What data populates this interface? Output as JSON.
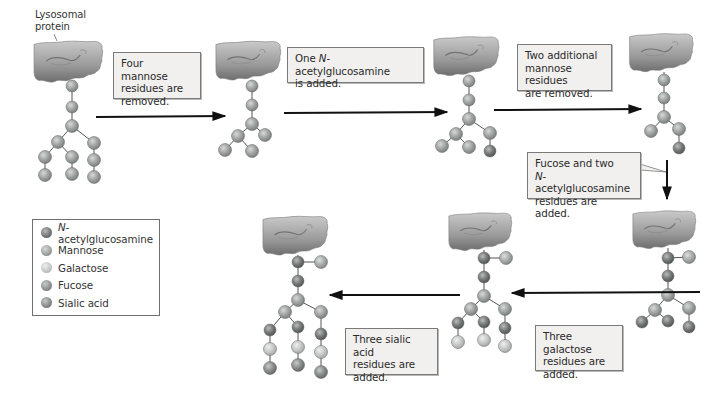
{
  "title_label": {
    "line1": "Lysosomal",
    "line2": "protein"
  },
  "steps": [
    {
      "id": 1,
      "lines": [
        "Four mannose",
        "residues are",
        "removed."
      ]
    },
    {
      "id": 2,
      "lines_prefix": "One ",
      "italic": "N",
      "lines_rest": "-acetylglucosamine",
      "line2": "is added."
    },
    {
      "id": 3,
      "lines": [
        "Two additional",
        "mannose residues",
        "are removed."
      ]
    },
    {
      "id": 4,
      "line1": "Fucose and two",
      "italic": "N",
      "line2_rest": "-acetylglucosamine",
      "line3": "residues are added."
    },
    {
      "id": 5,
      "lines": [
        "Three galactose",
        "residues are",
        "added."
      ]
    },
    {
      "id": 6,
      "lines": [
        "Three sialic acid",
        "residues are",
        "added."
      ]
    }
  ],
  "legend": {
    "items": [
      {
        "italic": "N",
        "label": "-acetylglucosamine",
        "color": "#6f7371"
      },
      {
        "italic": "",
        "label": "Mannose",
        "color": "#9a9e9c"
      },
      {
        "italic": "",
        "label": "Galactose",
        "color": "#c4c7c5"
      },
      {
        "italic": "",
        "label": "Fucose",
        "color": "#8c908e"
      },
      {
        "italic": "",
        "label": "Sialic acid",
        "color": "#888c8a"
      }
    ]
  },
  "colors": {
    "glcnac": "#6f7371",
    "mannose": "#9a9e9c",
    "galactose": "#c4c7c5",
    "fucose": "#a3a7a5",
    "sialic": "#85898a",
    "protein": "#9a9a9a",
    "arrow": "#111111",
    "bond": "#555555"
  }
}
